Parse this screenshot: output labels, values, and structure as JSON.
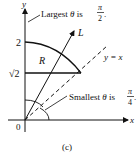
{
  "figure": {
    "caption": "(c)",
    "axes": {
      "x_label": "x",
      "y_label": "y",
      "origin_label": "0"
    },
    "y_ticks": [
      {
        "label": "2",
        "value": 2
      },
      {
        "label": "√2",
        "value": 1.4142
      }
    ],
    "region_label": "R",
    "ray_label": "L",
    "line_label": "y = x",
    "annotations": {
      "largest": {
        "prefix": "Largest ",
        "theta": "θ",
        "mid": " is ",
        "num": "π",
        "den": "2",
        "suffix": "."
      },
      "smallest": {
        "prefix": "Smallest ",
        "theta": "θ",
        "mid": " is ",
        "num": "π",
        "den": "4",
        "suffix": "."
      }
    },
    "colors": {
      "stroke": "#111111",
      "background": "#ffffff"
    }
  }
}
